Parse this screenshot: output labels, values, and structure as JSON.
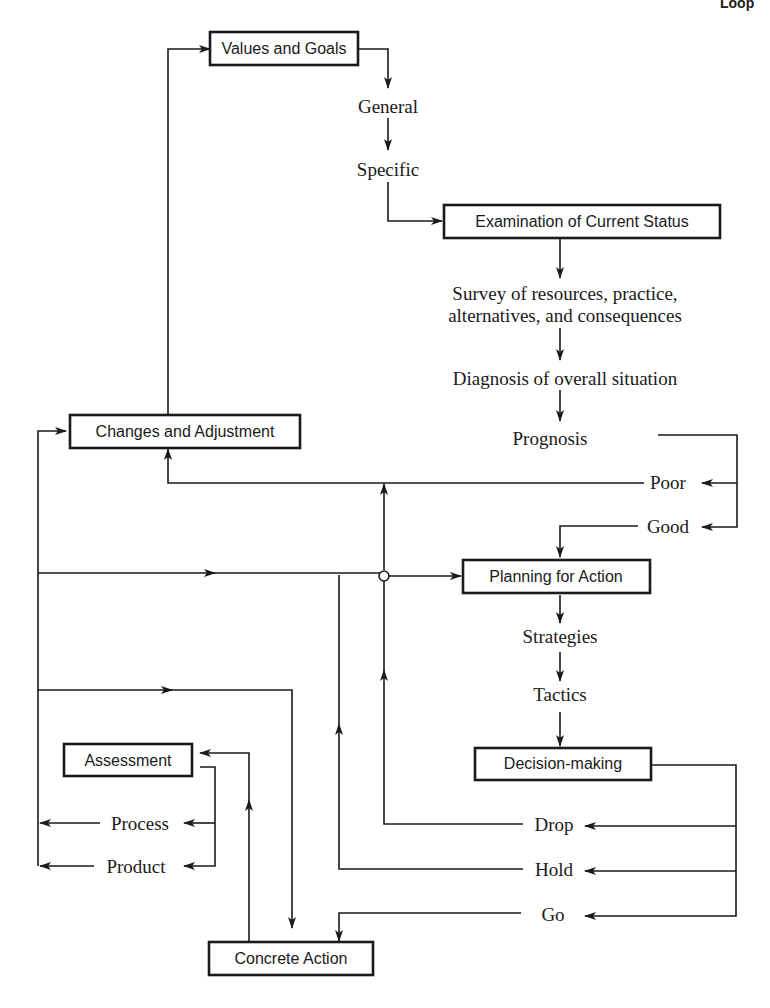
{
  "header": {
    "title_fragment": "Loop"
  },
  "boxes": {
    "values_goals": "Values and Goals",
    "examination": "Examination of Current Status",
    "changes": "Changes and Adjustment",
    "planning": "Planning for Action",
    "decision": "Decision-making",
    "assessment": "Assessment",
    "concrete": "Concrete Action"
  },
  "labels": {
    "general": "General",
    "specific": "Specific",
    "survey_line1": "Survey of resources, practice,",
    "survey_line2": "alternatives, and consequences",
    "diagnosis": "Diagnosis of overall situation",
    "prognosis": "Prognosis",
    "poor": "Poor",
    "good": "Good",
    "strategies": "Strategies",
    "tactics": "Tactics",
    "drop": "Drop",
    "hold": "Hold",
    "go": "Go",
    "process": "Process",
    "product": "Product"
  },
  "colors": {
    "ink": "#1a1a1a",
    "background": "#ffffff"
  }
}
